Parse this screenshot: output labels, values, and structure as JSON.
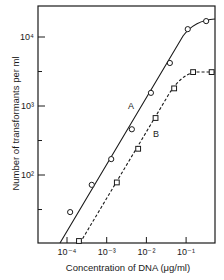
{
  "chart_data": {
    "type": "line",
    "title": "",
    "xlabel": "Concentration of DNA (μg/ml)",
    "ylabel": "Number of transformants per ml",
    "xscale": "log",
    "yscale": "log",
    "xlim": [
      3e-05,
      0.6
    ],
    "ylim": [
      10,
      25000
    ],
    "x_ticks": [
      {
        "value": 0.0001,
        "label": "10⁻⁴"
      },
      {
        "value": 0.001,
        "label": "10⁻³"
      },
      {
        "value": 0.01,
        "label": "10⁻²"
      },
      {
        "value": 0.1,
        "label": "10⁻¹"
      }
    ],
    "y_ticks": [
      {
        "value": 100,
        "label": "10²"
      },
      {
        "value": 1000,
        "label": "10³"
      },
      {
        "value": 10000,
        "label": "10⁴"
      }
    ],
    "grid": false,
    "legend": "inline labels",
    "series": [
      {
        "name": "A",
        "marker": "circle",
        "line": "solid",
        "points": [
          {
            "x": 0.00012,
            "y": 29
          },
          {
            "x": 0.00042,
            "y": 72
          },
          {
            "x": 0.0013,
            "y": 170
          },
          {
            "x": 0.0043,
            "y": 460
          },
          {
            "x": 0.013,
            "y": 1550
          },
          {
            "x": 0.039,
            "y": 4200
          },
          {
            "x": 0.11,
            "y": 13000
          },
          {
            "x": 0.32,
            "y": 17000
          }
        ]
      },
      {
        "name": "B",
        "marker": "square",
        "line": "dashed",
        "points": [
          {
            "x": 0.0002,
            "y": 11
          },
          {
            "x": 0.0018,
            "y": 78
          },
          {
            "x": 0.0062,
            "y": 240
          },
          {
            "x": 0.017,
            "y": 670
          },
          {
            "x": 0.05,
            "y": 1800
          },
          {
            "x": 0.15,
            "y": 3100
          },
          {
            "x": 0.44,
            "y": 3100
          }
        ]
      }
    ],
    "annotations": [
      {
        "text": "A",
        "series": "A"
      },
      {
        "text": "B",
        "series": "B"
      }
    ]
  }
}
